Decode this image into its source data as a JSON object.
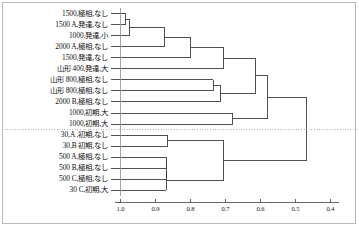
{
  "figure": {
    "title": "",
    "kind": "dendrogram",
    "background_color": "#ffffff",
    "line_color": "#333333",
    "cutline_color": "#9a9a9a"
  },
  "chart_data": {
    "type": "line",
    "subtype": "dendrogram",
    "title": "",
    "xlabel": "",
    "ylabel": "",
    "orientation": "horizontal-right-to-left",
    "xlim": [
      1.0,
      0.4
    ],
    "grid": false,
    "legend": null,
    "axis": {
      "tick_values": [
        1.0,
        0.9,
        0.8,
        0.7,
        0.6,
        0.5,
        0.4
      ],
      "tick_labels": [
        "1.0",
        "0.9",
        "0.8",
        "0.7",
        "0.6",
        "0.5",
        "0.4"
      ],
      "position": "bottom",
      "direction": "decreasing"
    },
    "cut_line": {
      "value": 0.53,
      "style": "dotted",
      "label": ""
    },
    "categories": [
      "1500,極相,なし",
      "1500 A,発達,なし",
      "1000,発達,小",
      "2000 A,極相,なし",
      "1500,発達,なし",
      "山形 400,発達,大",
      "山形 800,極相,なし",
      "山形 800,極相,なし",
      "2000 B,極相,なし",
      "1000,初期,大",
      "1000,初期,大",
      "30,A ,初期,なし",
      "30,B 初期,なし",
      "500 A,極相,なし",
      "500 B,極相,なし",
      "500 C,極相,なし",
      "30 C,初期,大"
    ],
    "leaves": [
      "1500,極相,なし",
      "1500 A,発達,なし",
      "1000,発達,小",
      "2000 A,極相,なし",
      "1500,発達,なし",
      "山形 400,発達,大",
      "山形 800,極相,なし",
      "山形 800,極相,なし",
      "2000 B,極相,なし",
      "1000,初期,大",
      "1000,初期,大",
      "30,A ,初期,なし",
      "30,B 初期,なし",
      "500 A,極相,なし",
      "500 B,極相,なし",
      "500 C,極相,なし",
      "30 C,初期,大"
    ],
    "merges": [
      {
        "id": "m1",
        "left": "leaf:0",
        "right": "leaf:1",
        "height": 0.985
      },
      {
        "id": "m2",
        "left": "m1",
        "right": "leaf:2",
        "height": 0.975
      },
      {
        "id": "m3",
        "left": "m2",
        "right": "leaf:3",
        "height": 0.875
      },
      {
        "id": "m4",
        "left": "m3",
        "right": "leaf:4",
        "height": 0.8
      },
      {
        "id": "m5",
        "left": "leaf:6",
        "right": "leaf:7",
        "height": 0.735
      },
      {
        "id": "m6",
        "left": "m5",
        "right": "leaf:8",
        "height": 0.715
      },
      {
        "id": "m7",
        "left": "m4",
        "right": "leaf:5",
        "height": 0.705
      },
      {
        "id": "m8",
        "left": "leaf:9",
        "right": "leaf:10",
        "height": 0.68
      },
      {
        "id": "m9",
        "left": "m7",
        "right": "m6",
        "height": 0.615
      },
      {
        "id": "m10",
        "left": "m9",
        "right": "m8",
        "height": 0.58
      },
      {
        "id": "m11",
        "left": "leaf:11",
        "right": "leaf:12",
        "height": 0.865
      },
      {
        "id": "m12",
        "left": "leaf:13",
        "right": "leaf:14",
        "height": 0.87
      },
      {
        "id": "m13",
        "left": "m12",
        "right": "leaf:15",
        "height": 0.87
      },
      {
        "id": "m14",
        "left": "m13",
        "right": "leaf:16",
        "height": 0.87
      },
      {
        "id": "m15",
        "left": "m11",
        "right": "m14",
        "height": 0.705
      },
      {
        "id": "m16",
        "left": "m10",
        "right": "m15",
        "height": 0.47
      }
    ]
  }
}
